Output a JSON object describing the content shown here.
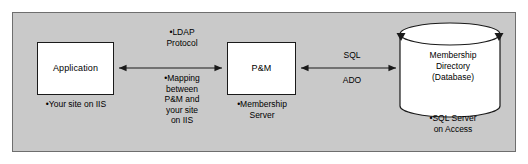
{
  "diagram": {
    "panel": {
      "background_color": "#c9c9c9",
      "border_color": "#6e6e6e"
    },
    "nodes": {
      "application": {
        "label": "Application",
        "caption": "•Your site on IIS",
        "shape": "rectangle"
      },
      "pm": {
        "label": "P&M",
        "caption": "•Membership\nServer",
        "shape": "rectangle"
      },
      "database": {
        "label": "Membership\nDirectory\n(Database)",
        "caption": "•SQL Server\non Access",
        "shape": "cylinder"
      }
    },
    "connections": {
      "app_to_pm": {
        "annotation_top": "•LDAP\nProtocol",
        "annotation_bottom": "•Mapping\nbetween\nP&M and\nyour site\non IIS",
        "direction": "bidirectional"
      },
      "pm_to_db": {
        "label_top": "SQL",
        "label_bottom": "ADO",
        "direction": "bidirectional"
      }
    },
    "colors": {
      "box_fill": "#ffffff",
      "stroke": "#1a1a1a",
      "text": "#000000"
    }
  }
}
